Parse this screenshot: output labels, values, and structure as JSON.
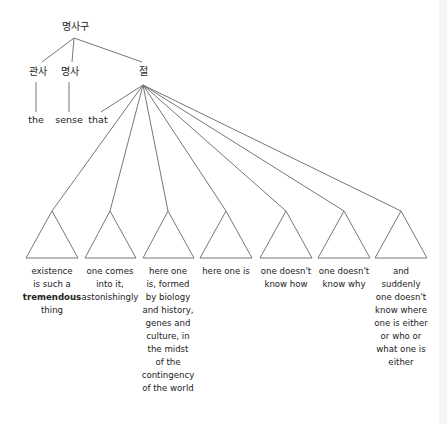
{
  "diagram": {
    "type": "syntax-tree",
    "root": {
      "label": "명사구"
    },
    "children": [
      {
        "label": "관사",
        "leaf": "the"
      },
      {
        "label": "명사",
        "leaf": "sense"
      },
      {
        "label": "절",
        "leaf": "that"
      }
    ],
    "clause_phrases": [
      {
        "lines": [
          "existence",
          "is such a",
          "tremendous",
          "thing"
        ],
        "bold_line_index": 2
      },
      {
        "lines": [
          "one comes",
          "into it,",
          "astonishingly"
        ]
      },
      {
        "lines": [
          "here one",
          "is, formed",
          "by biology",
          "and history,",
          "genes and",
          "culture, in",
          "the midst",
          "of the",
          "contingency",
          "of the world"
        ]
      },
      {
        "lines": [
          "here one is"
        ]
      },
      {
        "lines": [
          "one doesn't",
          "know how"
        ]
      },
      {
        "lines": [
          "one doesn't",
          "know why"
        ]
      },
      {
        "lines": [
          "and",
          "suddenly",
          "one doesn't",
          "know where",
          "one is either",
          "or who or",
          "what one is",
          "either"
        ]
      }
    ]
  },
  "colors": {
    "line": "#777777",
    "text": "#222222",
    "background": "#ffffff"
  }
}
